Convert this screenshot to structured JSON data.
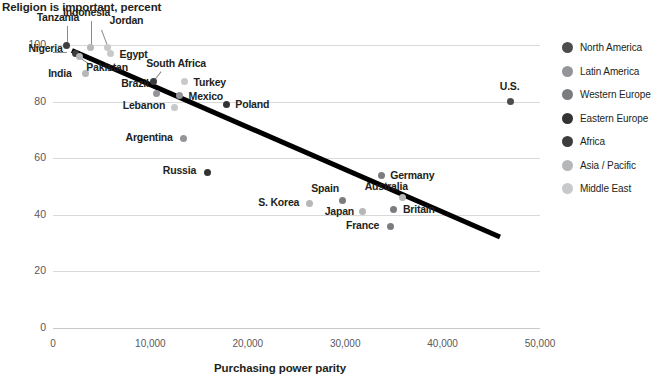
{
  "chart_data": {
    "type": "scatter",
    "title": "Religion is important, percent",
    "ylabel": "Religion is important, percent",
    "xlabel": "Purchasing power parity",
    "xlim": [
      0,
      50000
    ],
    "ylim": [
      0,
      100
    ],
    "xticks": [
      "0",
      "10,000",
      "20,000",
      "30,000",
      "40,000",
      "50,000"
    ],
    "xtick_values": [
      0,
      10000,
      20000,
      30000,
      40000,
      50000
    ],
    "yticks": [
      "0",
      "20",
      "40",
      "60",
      "80",
      "100"
    ],
    "ytick_values": [
      0,
      20,
      40,
      60,
      80,
      100
    ],
    "grid": true,
    "legend_position": "right",
    "trendline": {
      "x0": 2000,
      "y0": 99,
      "x1": 46000,
      "y1": 33
    },
    "points": [
      {
        "label": "Tanzania",
        "x": 1400,
        "y": 100,
        "region": "Africa"
      },
      {
        "label": "Nigeria",
        "x": 2300,
        "y": 97,
        "region": "Africa"
      },
      {
        "label": "Indonesia",
        "x": 3900,
        "y": 99,
        "region": "Asia / Pacific"
      },
      {
        "label": "Jordan",
        "x": 5600,
        "y": 99,
        "region": "Middle East"
      },
      {
        "label": "Egypt",
        "x": 5900,
        "y": 97,
        "region": "Middle East"
      },
      {
        "label": "Pakistan",
        "x": 2700,
        "y": 96,
        "region": "Asia / Pacific"
      },
      {
        "label": "India",
        "x": 3300,
        "y": 90,
        "region": "Asia / Pacific"
      },
      {
        "label": "South Africa",
        "x": 10300,
        "y": 87,
        "region": "Africa"
      },
      {
        "label": "Turkey",
        "x": 13500,
        "y": 87,
        "region": "Middle East"
      },
      {
        "label": "Brazil",
        "x": 10600,
        "y": 83,
        "region": "Latin America"
      },
      {
        "label": "Mexico",
        "x": 13000,
        "y": 82,
        "region": "Latin America"
      },
      {
        "label": "Lebanon",
        "x": 12500,
        "y": 78,
        "region": "Middle East"
      },
      {
        "label": "Poland",
        "x": 17800,
        "y": 79,
        "region": "Eastern Europe"
      },
      {
        "label": "Argentina",
        "x": 13400,
        "y": 67,
        "region": "Latin America"
      },
      {
        "label": "Russia",
        "x": 15900,
        "y": 55,
        "region": "Eastern Europe"
      },
      {
        "label": "Germany",
        "x": 33700,
        "y": 54,
        "region": "Western Europe"
      },
      {
        "label": "S. Korea",
        "x": 26300,
        "y": 44,
        "region": "Asia / Pacific"
      },
      {
        "label": "Spain",
        "x": 29700,
        "y": 45,
        "region": "Western Europe"
      },
      {
        "label": "Australia",
        "x": 35900,
        "y": 46,
        "region": "Asia / Pacific"
      },
      {
        "label": "Japan",
        "x": 31800,
        "y": 41,
        "region": "Asia / Pacific"
      },
      {
        "label": "Britain",
        "x": 35000,
        "y": 42,
        "region": "Western Europe"
      },
      {
        "label": "France",
        "x": 34700,
        "y": 36,
        "region": "Western Europe"
      },
      {
        "label": "U.S.",
        "x": 47000,
        "y": 80,
        "region": "North America"
      }
    ]
  },
  "legend": {
    "items": [
      {
        "label": "North America",
        "color": "#4d4d4d"
      },
      {
        "label": "Latin America",
        "color": "#939598"
      },
      {
        "label": "Western Europe",
        "color": "#7a7c7f"
      },
      {
        "label": "Eastern Europe",
        "color": "#333333"
      },
      {
        "label": "Africa",
        "color": "#3d3d3d"
      },
      {
        "label": "Asia / Pacific",
        "color": "#b5b7b9"
      },
      {
        "label": "Middle East",
        "color": "#c7c9cb"
      }
    ]
  }
}
